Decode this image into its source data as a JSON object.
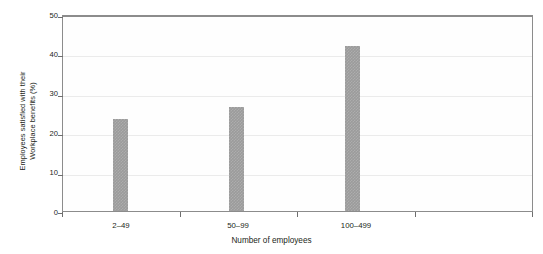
{
  "chart_data": {
    "type": "bar",
    "title": "",
    "subtitle": "",
    "xlabel": "Number of employees",
    "ylabel_line1": "Employees satisfied with their",
    "ylabel_line2": "Workplace benefits (%)",
    "categories": [
      "2–49",
      "50–99",
      "100–499"
    ],
    "values": [
      23.8,
      26.7,
      42.5
    ],
    "series": [
      {
        "name": "Employees satisfied with their workplace benefits (%)",
        "values": [
          23.8,
          26.7,
          42.5
        ]
      }
    ],
    "ylim": [
      0,
      50
    ],
    "ytick_values": [
      0,
      10,
      20,
      30,
      40,
      50
    ],
    "ytick_labels": [
      "0",
      "10",
      "20",
      "30",
      "40",
      "50"
    ],
    "xtick_boundaries": [
      0,
      1,
      2,
      3,
      4
    ],
    "grid": true,
    "grid_axis": "y",
    "legend": false,
    "legend_position": "none",
    "bar_color": "#9b9b9b",
    "gridline_color": "#ebebeb",
    "axis_color": "#8c8c8c",
    "text_color": "#231f20",
    "background_color": "#ffffff",
    "empty_category_slots": 1,
    "annotations": []
  }
}
